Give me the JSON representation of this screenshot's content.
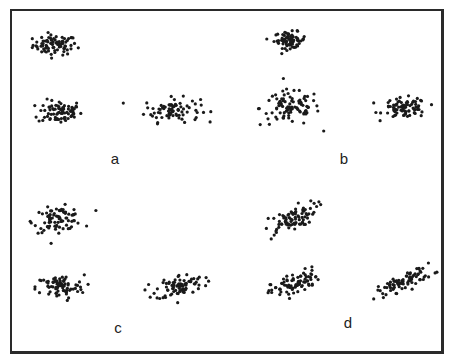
{
  "chart_data": {
    "type": "scatter",
    "title": "",
    "grid": false,
    "legend": null,
    "panels": [
      {
        "label": "a",
        "label_pos": [
          115,
          158
        ],
        "clusters": [
          {
            "cx": 55,
            "cy": 45,
            "sx": 11,
            "sy": 5,
            "rho": 0.0,
            "n": 80
          },
          {
            "cx": 60,
            "cy": 112,
            "sx": 11,
            "sy": 6,
            "rho": 0.0,
            "n": 80
          },
          {
            "cx": 172,
            "cy": 110,
            "sx": 14,
            "sy": 6,
            "rho": 0.0,
            "n": 80
          }
        ]
      },
      {
        "label": "b",
        "label_pos": [
          344,
          158
        ],
        "clusters": [
          {
            "cx": 290,
            "cy": 40,
            "sx": 8,
            "sy": 4,
            "rho": 0.0,
            "n": 70
          },
          {
            "cx": 290,
            "cy": 108,
            "sx": 15,
            "sy": 9,
            "rho": 0.0,
            "n": 90
          },
          {
            "cx": 405,
            "cy": 108,
            "sx": 11,
            "sy": 5,
            "rho": 0.0,
            "n": 80
          }
        ]
      },
      {
        "label": "c",
        "label_pos": [
          118,
          327
        ],
        "clusters": [
          {
            "cx": 58,
            "cy": 219,
            "sx": 12,
            "sy": 6,
            "rho": 0.2,
            "n": 80
          },
          {
            "cx": 60,
            "cy": 287,
            "sx": 12,
            "sy": 6,
            "rho": 0.0,
            "n": 80
          },
          {
            "cx": 180,
            "cy": 286,
            "sx": 12,
            "sy": 6,
            "rho": 0.3,
            "n": 80
          }
        ]
      },
      {
        "label": "d",
        "label_pos": [
          348,
          322
        ],
        "clusters": [
          {
            "cx": 290,
            "cy": 220,
            "sx": 13,
            "sy": 8,
            "rho": 0.7,
            "n": 80
          },
          {
            "cx": 295,
            "cy": 284,
            "sx": 12,
            "sy": 7,
            "rho": 0.6,
            "n": 80
          },
          {
            "cx": 405,
            "cy": 281,
            "sx": 14,
            "sy": 7,
            "rho": 0.8,
            "n": 80
          }
        ]
      }
    ],
    "point_color": "#1a1a1a",
    "point_radius": 1.6
  }
}
